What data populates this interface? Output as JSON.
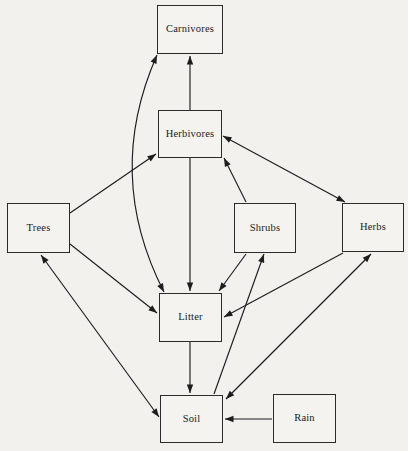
{
  "diagram": {
    "background_color": "#f2f1ee",
    "line_color": "#1d1d1d",
    "box_fill": "#f4f3f0",
    "nodes": [
      {
        "id": "carnivores",
        "label": "Carnivores",
        "x": 157,
        "y": 5,
        "w": 66,
        "h": 49
      },
      {
        "id": "herbivores",
        "label": "Herbivores",
        "x": 158,
        "y": 110,
        "w": 64,
        "h": 48
      },
      {
        "id": "trees",
        "label": "Trees",
        "x": 7,
        "y": 203,
        "w": 63,
        "h": 50
      },
      {
        "id": "shrubs",
        "label": "Shrubs",
        "x": 234,
        "y": 203,
        "w": 62,
        "h": 50
      },
      {
        "id": "herbs",
        "label": "Herbs",
        "x": 342,
        "y": 203,
        "w": 62,
        "h": 49
      },
      {
        "id": "litter",
        "label": "Litter",
        "x": 159,
        "y": 293,
        "w": 63,
        "h": 49
      },
      {
        "id": "soil",
        "label": "Soil",
        "x": 160,
        "y": 395,
        "w": 63,
        "h": 48
      },
      {
        "id": "rain",
        "label": "Rain",
        "x": 273,
        "y": 394,
        "w": 63,
        "h": 49
      }
    ],
    "edges": [
      {
        "id": "herbivores-to-carnivores",
        "from": "herbivores",
        "to": "carnivores",
        "kind": "straight",
        "heads": "end",
        "x1": 190,
        "y1": 110,
        "x2": 190,
        "y2": 56
      },
      {
        "id": "litter-carnivores-curve",
        "from": "litter",
        "to": "carnivores",
        "kind": "curve",
        "heads": "both",
        "x1": 157,
        "y1": 55,
        "x2": 164,
        "y2": 292,
        "cx": 104,
        "cy": 175
      },
      {
        "id": "trees-to-herbivores",
        "from": "trees",
        "to": "herbivores",
        "kind": "straight",
        "heads": "end",
        "x1": 70,
        "y1": 213,
        "x2": 156,
        "y2": 154
      },
      {
        "id": "shrubs-to-herbivores",
        "from": "shrubs",
        "to": "herbivores",
        "kind": "straight",
        "heads": "end",
        "x1": 246,
        "y1": 202,
        "x2": 224,
        "y2": 158
      },
      {
        "id": "herbivores-herbs",
        "from": "herbivores",
        "to": "herbs",
        "kind": "straight",
        "heads": "both",
        "x1": 223,
        "y1": 136,
        "x2": 345,
        "y2": 202
      },
      {
        "id": "herbivores-to-litter",
        "from": "herbivores",
        "to": "litter",
        "kind": "straight",
        "heads": "end",
        "x1": 190,
        "y1": 158,
        "x2": 190,
        "y2": 291
      },
      {
        "id": "trees-to-litter",
        "from": "trees",
        "to": "litter",
        "kind": "straight",
        "heads": "end",
        "x1": 70,
        "y1": 244,
        "x2": 157,
        "y2": 313
      },
      {
        "id": "shrubs-to-litter",
        "from": "shrubs",
        "to": "litter",
        "kind": "straight",
        "heads": "end",
        "x1": 246,
        "y1": 254,
        "x2": 219,
        "y2": 291
      },
      {
        "id": "herbs-to-litter",
        "from": "herbs",
        "to": "litter",
        "kind": "straight",
        "heads": "end",
        "x1": 343,
        "y1": 253,
        "x2": 224,
        "y2": 317
      },
      {
        "id": "litter-to-soil",
        "from": "litter",
        "to": "soil",
        "kind": "straight",
        "heads": "end",
        "x1": 190,
        "y1": 342,
        "x2": 190,
        "y2": 393
      },
      {
        "id": "trees-soil",
        "from": "trees",
        "to": "soil",
        "kind": "straight",
        "heads": "both",
        "x1": 41,
        "y1": 255,
        "x2": 159,
        "y2": 417
      },
      {
        "id": "soil-to-shrubs",
        "from": "soil",
        "to": "shrubs",
        "kind": "straight",
        "heads": "end",
        "x1": 214,
        "y1": 394,
        "x2": 264,
        "y2": 254
      },
      {
        "id": "soil-herbs",
        "from": "soil",
        "to": "herbs",
        "kind": "both",
        "heads": "both",
        "x1": 226,
        "y1": 399,
        "x2": 371,
        "y2": 254
      },
      {
        "id": "rain-to-soil",
        "from": "rain",
        "to": "soil",
        "kind": "straight",
        "heads": "end",
        "x1": 272,
        "y1": 419,
        "x2": 225,
        "y2": 419
      }
    ]
  }
}
